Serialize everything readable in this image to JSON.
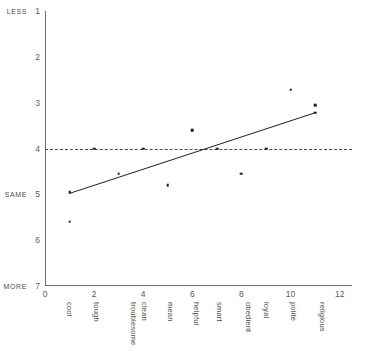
{
  "chart_data": {
    "type": "scatter",
    "title": "",
    "xlabel": "",
    "ylabel": "",
    "xlim": [
      0,
      12.5
    ],
    "ylim": [
      1,
      7
    ],
    "y_inverted": true,
    "grid": false,
    "legend": null,
    "x_ticks": [
      0,
      2,
      4,
      6,
      8,
      10,
      12
    ],
    "y_ticks": [
      1,
      2,
      3,
      4,
      5,
      6,
      7
    ],
    "y_anchor_labels": [
      {
        "value": 1,
        "label": "LESS"
      },
      {
        "value": 5,
        "label": "SAME"
      },
      {
        "value": 7,
        "label": "MORE"
      }
    ],
    "categories": [
      "cool",
      "tough",
      "troublesome",
      "clean",
      "mean",
      "helpful",
      "smart",
      "obedient",
      "loyal",
      "polite",
      "religious"
    ],
    "category_x": [
      1,
      2,
      3,
      4,
      5,
      6,
      7,
      8,
      9,
      10,
      11
    ],
    "points": [
      {
        "x": 1,
        "y": 4.95,
        "category": "cool"
      },
      {
        "x": 1,
        "y": 5.6,
        "category": "cool"
      },
      {
        "x": 2,
        "y": 4.0,
        "category": "tough"
      },
      {
        "x": 3,
        "y": 4.55,
        "category": "troublesome"
      },
      {
        "x": 4,
        "y": 4.0,
        "category": "clean"
      },
      {
        "x": 5,
        "y": 4.8,
        "category": "mean"
      },
      {
        "x": 6,
        "y": 3.6,
        "category": "helpful"
      },
      {
        "x": 7,
        "y": 4.0,
        "category": "smart"
      },
      {
        "x": 8,
        "y": 4.55,
        "category": "obedient"
      },
      {
        "x": 9,
        "y": 4.0,
        "category": "loyal"
      },
      {
        "x": 10,
        "y": 2.72,
        "category": "polite"
      },
      {
        "x": 11,
        "y": 3.05,
        "category": "religious"
      },
      {
        "x": 11,
        "y": 3.22,
        "category": "religious"
      }
    ],
    "reference_line": {
      "y": 4.0,
      "style": "dashed",
      "label": ""
    },
    "trend_line": {
      "style": "solid",
      "x0": 1.0,
      "y0": 4.98,
      "x1": 11.0,
      "y1": 3.22
    }
  },
  "annotations": {
    "top_strip": ""
  }
}
